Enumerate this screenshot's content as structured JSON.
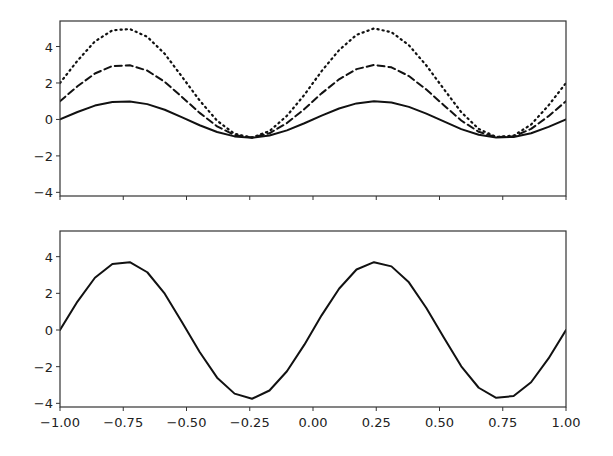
{
  "figure": {
    "width": 613,
    "height": 456,
    "background": "#ffffff",
    "line_color": "#111111"
  },
  "chart_data": [
    {
      "type": "line",
      "title": "",
      "xlabel": "",
      "ylabel": "",
      "xlim": [
        -1.0,
        1.0
      ],
      "ylim": [
        -4.2,
        5.4
      ],
      "grid": false,
      "legend": null,
      "axes_box": {
        "left": 60,
        "top": 21,
        "right": 566,
        "bottom": 196
      },
      "xticks": [
        -1.0,
        -0.75,
        -0.5,
        -0.25,
        0.0,
        0.25,
        0.5,
        0.75,
        1.0
      ],
      "xtick_labels": [],
      "yticks": [
        -4,
        -2,
        0,
        2,
        4
      ],
      "ytick_labels": [
        "−4",
        "−2",
        "0",
        "2",
        "4"
      ],
      "x": [
        -1.0,
        -0.931,
        -0.862,
        -0.793,
        -0.724,
        -0.655,
        -0.586,
        -0.517,
        -0.448,
        -0.379,
        -0.31,
        -0.241,
        -0.172,
        -0.103,
        -0.034,
        0.034,
        0.103,
        0.172,
        0.241,
        0.31,
        0.379,
        0.448,
        0.517,
        0.586,
        0.655,
        0.724,
        0.793,
        0.862,
        0.931,
        1.0
      ],
      "series": [
        {
          "name": "sin(2πx)",
          "style": "solid",
          "values": [
            0.0,
            0.41,
            0.76,
            0.96,
            0.99,
            0.84,
            0.53,
            0.11,
            -0.32,
            -0.69,
            -0.93,
            -1.0,
            -0.88,
            -0.6,
            -0.21,
            0.21,
            0.6,
            0.88,
            1.0,
            0.93,
            0.69,
            0.32,
            -0.11,
            -0.53,
            -0.84,
            -0.99,
            -0.96,
            -0.76,
            -0.41,
            0.0
          ]
        },
        {
          "name": "1 + 2·sin(2πx)",
          "style": "dashed",
          "values": [
            1.0,
            1.82,
            2.52,
            2.93,
            2.97,
            2.68,
            2.06,
            1.22,
            0.36,
            -0.38,
            -0.86,
            -0.99,
            -0.76,
            -0.2,
            0.57,
            1.43,
            2.2,
            2.76,
            2.99,
            2.86,
            2.38,
            1.64,
            0.78,
            -0.06,
            -0.68,
            -0.97,
            -0.93,
            -0.52,
            0.18,
            1.0
          ]
        },
        {
          "name": "2 + 3·sin(2πx)",
          "style": "dotted",
          "values": [
            2.0,
            3.22,
            4.28,
            4.89,
            4.96,
            4.53,
            3.6,
            2.33,
            1.04,
            -0.07,
            -0.79,
            -0.99,
            -0.64,
            0.2,
            1.35,
            2.65,
            3.8,
            4.64,
            4.99,
            4.79,
            4.07,
            2.96,
            1.67,
            0.4,
            -0.52,
            -0.96,
            -0.89,
            -0.28,
            0.77,
            2.0
          ]
        }
      ]
    },
    {
      "type": "line",
      "title": "",
      "xlabel": "",
      "ylabel": "",
      "xlim": [
        -1.0,
        1.0
      ],
      "ylim": [
        -4.2,
        5.4
      ],
      "grid": false,
      "legend": null,
      "axes_box": {
        "left": 60,
        "top": 231,
        "right": 566,
        "bottom": 407
      },
      "xticks": [
        -1.0,
        -0.75,
        -0.5,
        -0.25,
        0.0,
        0.25,
        0.5,
        0.75,
        1.0
      ],
      "xtick_labels": [
        "−1.00",
        "−0.75",
        "−0.50",
        "−0.25",
        "0.00",
        "0.25",
        "0.50",
        "0.75",
        "1.00"
      ],
      "yticks": [
        -4,
        -2,
        0,
        2,
        4
      ],
      "ytick_labels": [
        "−4",
        "−2",
        "0",
        "2",
        "4"
      ],
      "x": [
        -1.0,
        -0.931,
        -0.862,
        -0.793,
        -0.724,
        -0.655,
        -0.586,
        -0.517,
        -0.448,
        -0.379,
        -0.31,
        -0.241,
        -0.172,
        -0.103,
        -0.034,
        0.034,
        0.103,
        0.172,
        0.241,
        0.31,
        0.379,
        0.448,
        0.517,
        0.586,
        0.655,
        0.724,
        0.793,
        0.862,
        0.931,
        1.0
      ],
      "series": [
        {
          "name": "combined",
          "style": "solid",
          "values": [
            0.0,
            1.55,
            2.85,
            3.6,
            3.7,
            3.15,
            1.98,
            0.41,
            -1.2,
            -2.6,
            -3.47,
            -3.75,
            -3.3,
            -2.25,
            -0.8,
            0.8,
            2.25,
            3.3,
            3.7,
            3.47,
            2.6,
            1.2,
            -0.41,
            -1.98,
            -3.15,
            -3.7,
            -3.6,
            -2.85,
            -1.55,
            0.0
          ]
        }
      ]
    }
  ]
}
